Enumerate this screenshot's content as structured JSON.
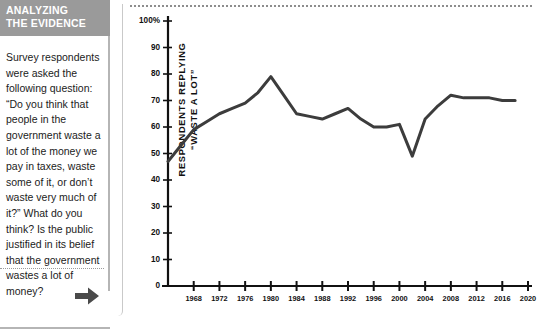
{
  "sidebar": {
    "header_line1": "ANALYZING",
    "header_line2": "THE EVIDENCE",
    "header_bg": "#9a9a9a",
    "body_text": "Survey respondents were asked the following question: “Do you think that people in the government waste a lot of the money we pay in taxes, waste some of it, or don’t waste very much of it?” What do you think? Is the public justified in its belief that the government wastes a lot of money?",
    "arrow_icon_name": "arrow-right-icon",
    "arrow_color": "#4a4a4a"
  },
  "chart_data": {
    "type": "line",
    "title": "",
    "subtitle": "",
    "xlabel": "",
    "ylabel": "RESPONDENTS REPLYING “WASTE A LOT”",
    "ylabel_line1": "RESPONDENTS REPLYING",
    "ylabel_line2": "“WASTE A LOT”",
    "xlim": [
      1964,
      2020
    ],
    "ylim": [
      0,
      100
    ],
    "grid": false,
    "legend": "none",
    "line_color": "#3c3c3c",
    "line_width": 3,
    "y_ticks": [
      0,
      10,
      20,
      30,
      40,
      50,
      60,
      70,
      80,
      90,
      100
    ],
    "y_tick_labels": [
      "0",
      "10",
      "20",
      "30",
      "40",
      "50",
      "60",
      "70",
      "80",
      "90",
      "100%"
    ],
    "x_ticks": [
      1968,
      1972,
      1976,
      1980,
      1984,
      1988,
      1992,
      1996,
      2000,
      2004,
      2008,
      2012,
      2016,
      2020
    ],
    "x_tick_labels": [
      "1968",
      "1972",
      "1976",
      "1980",
      "1984",
      "1988",
      "1992",
      "1996",
      "2000",
      "2004",
      "2008",
      "2012",
      "2016",
      "2020"
    ],
    "x": [
      1964,
      1966,
      1968,
      1970,
      1972,
      1974,
      1976,
      1978,
      1980,
      1982,
      1984,
      1986,
      1988,
      1990,
      1992,
      1994,
      1996,
      1998,
      2000,
      2002,
      2004,
      2006,
      2008,
      2010,
      2012,
      2014,
      2016,
      2018
    ],
    "values": [
      47,
      53,
      59,
      62,
      65,
      67,
      69,
      73,
      79,
      72,
      65,
      64,
      63,
      65,
      67,
      63,
      60,
      60,
      61,
      49,
      63,
      68,
      72,
      71,
      71,
      71,
      71,
      70
    ],
    "series": [
      {
        "name": "Respondents replying “waste a lot”",
        "values": [
          47,
          53,
          59,
          62,
          65,
          67,
          69,
          73,
          79,
          72,
          65,
          64,
          63,
          65,
          67,
          63,
          60,
          60,
          61,
          49,
          63,
          68,
          72,
          71,
          71,
          71,
          70,
          70
        ]
      }
    ],
    "annotations": []
  }
}
